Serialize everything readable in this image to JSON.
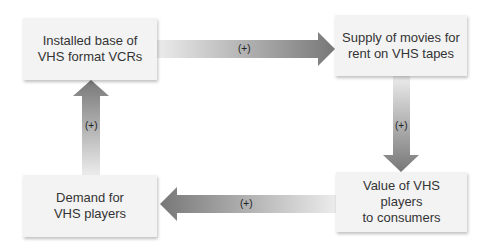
{
  "diagram": {
    "nodes": [
      {
        "id": "installed-base",
        "label": "Installed base of\nVHS format VCRs"
      },
      {
        "id": "supply-movies",
        "label": "Supply of movies for\nrent on VHS tapes"
      },
      {
        "id": "value-players",
        "label": "Value of VHS\nplayers\nto consumers"
      },
      {
        "id": "demand-players",
        "label": "Demand for\nVHS players"
      }
    ],
    "edges": [
      {
        "from": "installed-base",
        "to": "supply-movies",
        "label": "(+)"
      },
      {
        "from": "supply-movies",
        "to": "value-players",
        "label": "(+)"
      },
      {
        "from": "value-players",
        "to": "demand-players",
        "label": "(+)"
      },
      {
        "from": "demand-players",
        "to": "installed-base",
        "label": "(+)"
      }
    ],
    "colors": {
      "box": "#f3f3f3",
      "arrow_dark": "#7a7a7a",
      "arrow_light": "#e6e6e6"
    }
  }
}
